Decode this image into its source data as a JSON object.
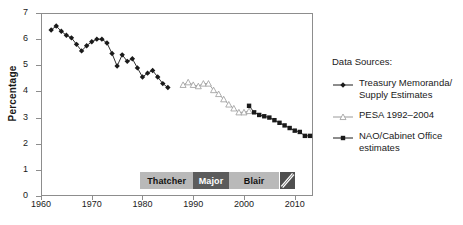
{
  "chart_data": {
    "type": "line",
    "title": "",
    "xlabel": "",
    "ylabel": "Percentage",
    "xlim": [
      1960,
      2013
    ],
    "ylim": [
      0,
      7
    ],
    "grid": false,
    "legend_position": "right",
    "y_ticks": [
      "0",
      "1",
      "2",
      "3",
      "4",
      "5",
      "6",
      "7"
    ],
    "x_ticks": [
      "1960",
      "1970",
      "1980",
      "1990",
      "2000",
      "2010"
    ],
    "series": [
      {
        "name": "Treasury Memoranda/ Supply Estimates",
        "marker": "filled-diamond",
        "color": "#1a1a1a",
        "x": [
          1962,
          1963,
          1964,
          1965,
          1966,
          1967,
          1968,
          1969,
          1970,
          1971,
          1972,
          1973,
          1974,
          1975,
          1976,
          1977,
          1978,
          1979,
          1980,
          1981,
          1982,
          1983,
          1984,
          1985
        ],
        "values": [
          6.35,
          6.5,
          6.3,
          6.15,
          6.05,
          5.8,
          5.55,
          5.75,
          5.9,
          6.0,
          6.0,
          5.85,
          5.45,
          4.97,
          5.4,
          5.15,
          5.25,
          4.9,
          4.55,
          4.7,
          4.8,
          4.55,
          4.3,
          4.15
        ]
      },
      {
        "name": "PESA 1992–2004",
        "marker": "open-triangle",
        "color": "#9a9a9a",
        "x": [
          1988,
          1989,
          1990,
          1991,
          1992,
          1993,
          1994,
          1995,
          1996,
          1997,
          1998,
          1999,
          2000,
          2001
        ],
        "values": [
          4.25,
          4.35,
          4.25,
          4.2,
          4.3,
          4.3,
          4.05,
          3.9,
          3.7,
          3.5,
          3.35,
          3.2,
          3.2,
          3.25
        ]
      },
      {
        "name": "NAO/Cabinet Office estimates",
        "marker": "filled-square",
        "color": "#1a1a1a",
        "x": [
          2001,
          2002,
          2003,
          2004,
          2005,
          2006,
          2007,
          2008,
          2009,
          2010,
          2011,
          2012,
          2013
        ],
        "values": [
          3.45,
          3.2,
          3.1,
          3.05,
          3.0,
          2.9,
          2.8,
          2.7,
          2.6,
          2.5,
          2.45,
          2.3,
          2.3
        ]
      }
    ],
    "annotations": [
      {
        "label": "Thatcher",
        "start": 1979.5,
        "end": 1990.0,
        "style": "light"
      },
      {
        "label": "Major",
        "start": 1990.0,
        "end": 1997.0,
        "style": "dark"
      },
      {
        "label": "Blair",
        "start": 1997.0,
        "end": 2007.0,
        "style": "light"
      },
      {
        "label": "",
        "start": 2007.0,
        "end": 2010.0,
        "style": "hatched"
      }
    ]
  },
  "legend": {
    "title": "Data Sources:",
    "entries": [
      {
        "label": "Treasury Memoranda/ Supply Estimates",
        "marker": "filled-diamond",
        "color": "#1a1a1a"
      },
      {
        "label": "PESA 1992–2004",
        "marker": "open-triangle",
        "color": "#9a9a9a"
      },
      {
        "label": "NAO/Cabinet Office estimates",
        "marker": "filled-square",
        "color": "#1a1a1a"
      }
    ]
  }
}
